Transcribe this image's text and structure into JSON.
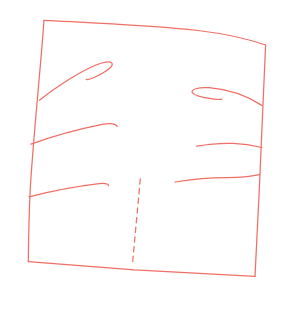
{
  "canvas": {
    "width": 282,
    "height": 329,
    "background_color": "#ffffff"
  },
  "sketch": {
    "description": "hand-drawn skewed square outline with three curved claw-like strokes on the left side, three on the right side (top ones ending in curled hooks), and a vertical dashed line near the bottom center",
    "stroke_color": "#ef6f65",
    "stroke_width": 1.25,
    "strokes": [
      {
        "name": "outline-top-edge",
        "d": "M 44,20.3 C 85,22.6 150,25.3 198,30.5 C 226,33.8 251,40 265.6,45"
      },
      {
        "name": "outline-right-edge",
        "d": "M 265.6,45 C 263.5,100 259,200 255,276.4"
      },
      {
        "name": "outline-bottom-edge",
        "d": "M 28.3,261.6 L 134.5,269.9 L 255,276.4"
      },
      {
        "name": "outline-left-edge",
        "d": "M 44,20.3 C 40.5,70 33,140 30.2,190 C 29,215 28.5,243 28.3,261.6"
      },
      {
        "name": "left-upper-curl",
        "d": "M 39.4,100.2 C 54,88.5 78,72.5 96,65 C 106,60.9 112.8,60.7 112.2,64.6 C 111.7,68.2 101.5,74.3 93.5,77.8 C 89.5,79.5 87,79.8 86.2,79.2"
      },
      {
        "name": "left-middle-curve",
        "d": "M 31,144.2 C 52,136.5 83,128.3 103.5,124.2 C 110.5,122.9 116.2,123.9 117.2,126.4"
      },
      {
        "name": "left-lower-curve",
        "d": "M 29,196.8 C 53,190.8 80,186 99,183.7 C 104.5,183.1 108.2,184.1 108.6,185.6"
      },
      {
        "name": "right-upper-curl",
        "d": "M 261.8,105.4 C 248,96.5 229,89.3 209,87.7 C 198.5,86.9 189.8,89.6 192.5,92.9 C 195,95.9 204,97.7 212.5,98.9 C 217,99.5 220.8,99.6 221.8,99.1"
      },
      {
        "name": "right-middle-curve",
        "d": "M 196.5,146.2 C 208,144.2 222,143 233,143.4 C 243,143.8 254,145.6 261.9,147.5"
      },
      {
        "name": "right-lower-curve",
        "d": "M 175,182 C 192,179.2 212,177.6 228,177.6 C 240,177.6 252,176.2 259.8,174.6"
      },
      {
        "name": "center-dashed-line",
        "d": "M 140.3,178.8 L 132.4,264.8",
        "dash": "5.4,4.3"
      }
    ]
  }
}
